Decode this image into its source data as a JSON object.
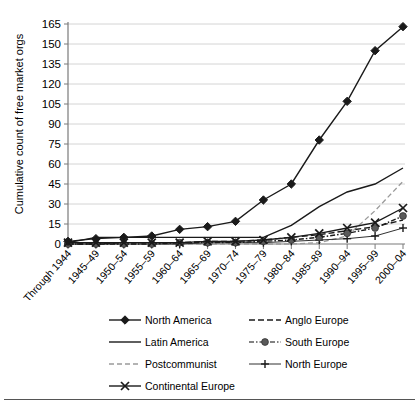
{
  "chart_data": {
    "type": "line",
    "title": "",
    "xlabel": "",
    "ylabel": "Cumulative count of free market orgs",
    "grid": true,
    "legend_position": "bottom",
    "ylim": [
      0,
      165
    ],
    "yticks": [
      0,
      15,
      30,
      45,
      60,
      75,
      90,
      105,
      120,
      135,
      150,
      165
    ],
    "categories": [
      "Through 1944",
      "1945–49",
      "1950–54",
      "1955–59",
      "1960–64",
      "1965–69",
      "1970–74",
      "1975–79",
      "1980–84",
      "1985–89",
      "1990–94",
      "1995–99",
      "2000–04"
    ],
    "series": [
      {
        "name": "North America",
        "marker": "filled-diamond",
        "dash": "solid",
        "color": "#1a1a1a",
        "values": [
          2,
          4,
          5,
          6,
          11,
          13,
          17,
          33,
          45,
          78,
          107,
          145,
          163
        ]
      },
      {
        "name": "Latin America",
        "marker": "none",
        "dash": "solid",
        "color": "#1a1a1a",
        "values": [
          1,
          5,
          5,
          5,
          5,
          5,
          5,
          5,
          14,
          28,
          39,
          45,
          57
        ]
      },
      {
        "name": "Postcommunist",
        "marker": "none",
        "dash": "dashed-light",
        "color": "#9a9a9a",
        "values": [
          0,
          0,
          0,
          0,
          0,
          0,
          0,
          0,
          0,
          1,
          6,
          25,
          47
        ]
      },
      {
        "name": "Continental Europe",
        "marker": "x",
        "dash": "solid",
        "color": "#1a1a1a",
        "values": [
          1,
          1,
          1,
          1,
          1,
          2,
          2,
          3,
          5,
          8,
          12,
          16,
          27
        ]
      },
      {
        "name": "Anglo Europe",
        "marker": "none",
        "dash": "dashed",
        "color": "#1a1a1a",
        "values": [
          0,
          0,
          1,
          1,
          1,
          2,
          2,
          3,
          5,
          7,
          10,
          13,
          18
        ]
      },
      {
        "name": "South Europe",
        "marker": "filled-circle",
        "dash": "dash-dot",
        "color": "#5a5a5a",
        "values": [
          0,
          0,
          0,
          0,
          1,
          1,
          1,
          2,
          3,
          5,
          8,
          12,
          21
        ]
      },
      {
        "name": "North Europe",
        "marker": "plus",
        "dash": "solid-thin",
        "color": "#1a1a1a",
        "values": [
          0,
          0,
          0,
          0,
          0,
          1,
          1,
          1,
          2,
          3,
          4,
          6,
          12
        ]
      }
    ],
    "legend_entries": [
      {
        "label": "North America",
        "marker": "filled-diamond",
        "dash": "solid",
        "color": "#1a1a1a"
      },
      {
        "label": "Anglo Europe",
        "marker": "none",
        "dash": "dashed",
        "color": "#1a1a1a"
      },
      {
        "label": "Latin America",
        "marker": "none",
        "dash": "solid",
        "color": "#1a1a1a"
      },
      {
        "label": "South Europe",
        "marker": "filled-circle",
        "dash": "dash-dot",
        "color": "#5a5a5a"
      },
      {
        "label": "Postcommunist",
        "marker": "none",
        "dash": "dashed-light",
        "color": "#9a9a9a"
      },
      {
        "label": "North Europe",
        "marker": "plus",
        "dash": "solid-thin",
        "color": "#1a1a1a"
      },
      {
        "label": "Continental Europe",
        "marker": "x",
        "dash": "solid",
        "color": "#1a1a1a"
      }
    ]
  }
}
